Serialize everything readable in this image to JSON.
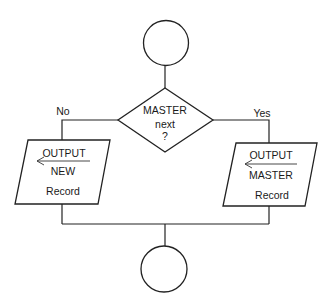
{
  "diagram": {
    "type": "flowchart",
    "nodes": {
      "start": {
        "kind": "connector-circle",
        "label": ""
      },
      "decision": {
        "kind": "decision-diamond",
        "lines": [
          "MASTER",
          "next",
          "?"
        ]
      },
      "output_new": {
        "kind": "output-parallelogram",
        "lines": [
          "OUTPUT",
          "NEW",
          "Record"
        ],
        "arrow": "left"
      },
      "output_master": {
        "kind": "output-parallelogram",
        "lines": [
          "OUTPUT",
          "MASTER",
          "Record"
        ],
        "arrow": "left"
      },
      "end": {
        "kind": "connector-circle",
        "label": ""
      }
    },
    "branches": {
      "no": "No",
      "yes": "Yes"
    },
    "edges": [
      {
        "from": "start",
        "to": "decision",
        "label": ""
      },
      {
        "from": "decision",
        "to": "output_new",
        "label": "No"
      },
      {
        "from": "decision",
        "to": "output_master",
        "label": "Yes"
      },
      {
        "from": "output_new",
        "to": "end",
        "label": ""
      },
      {
        "from": "output_master",
        "to": "end",
        "label": ""
      }
    ],
    "colors": {
      "stroke": "#222222",
      "background": "#ffffff",
      "text": "#1a1a1a"
    }
  }
}
